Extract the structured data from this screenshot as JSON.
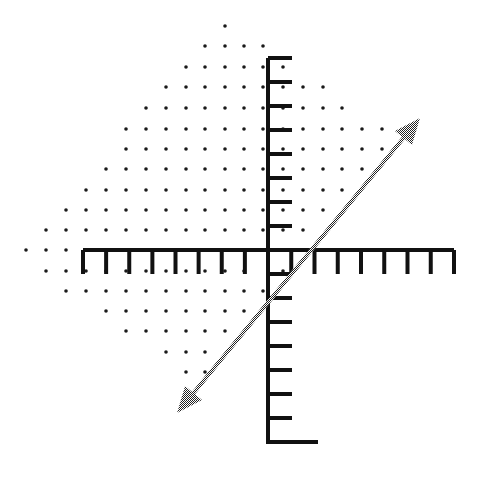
{
  "figure": {
    "type": "graph-of-linear-inequality",
    "colors": {
      "axis": "#111111",
      "dots": "#1a1a1a",
      "line": "#555555",
      "background": "#ffffff"
    },
    "axes": {
      "origin_px": [
        268,
        250
      ],
      "unit_px": 23.5,
      "x_axis": {
        "from_px": 83,
        "to_px": 454,
        "ticks_left": 8,
        "ticks_right": 8,
        "tick_direction": "down",
        "tick_length": 24
      },
      "y_axis": {
        "from_px": 58,
        "to_px": 442,
        "ticks_up": 8,
        "ticks_down": 8,
        "tick_direction": "right",
        "tick_length": 24,
        "bottom_tail_to_px": 318
      }
    },
    "line": {
      "equation": "y = x - 2",
      "slope": 1,
      "y_intercept": -2,
      "x_intercept": 2,
      "start_px": [
        177,
        413
      ],
      "end_px": [
        420,
        118
      ],
      "arrows": "both",
      "style": "dithered"
    },
    "shaded_region": {
      "style": "dot-grid",
      "side": "above-left of line",
      "inequality": "y > x - 2",
      "dot_spacing_px": [
        20,
        20.4
      ],
      "rows": [
        {
          "y": 26,
          "x": [
            225
          ]
        },
        {
          "y": 46,
          "x": [
            205,
            225,
            244,
            263
          ]
        },
        {
          "y": 67,
          "x": [
            186,
            205,
            225,
            244,
            263,
            283
          ]
        },
        {
          "y": 87,
          "x": [
            166,
            186,
            205,
            225,
            244,
            263,
            283,
            303,
            323
          ]
        },
        {
          "y": 108,
          "x": [
            146,
            166,
            186,
            205,
            225,
            244,
            263,
            283,
            303,
            323,
            342
          ]
        },
        {
          "y": 129,
          "x": [
            126,
            146,
            166,
            186,
            205,
            225,
            244,
            263,
            283,
            303,
            323,
            342,
            362,
            382
          ]
        },
        {
          "y": 149,
          "x": [
            126,
            146,
            166,
            186,
            205,
            225,
            244,
            263,
            283,
            303,
            323,
            342,
            362,
            382
          ]
        },
        {
          "y": 169,
          "x": [
            106,
            126,
            146,
            166,
            186,
            205,
            225,
            244,
            263,
            283,
            303,
            323,
            342,
            362
          ]
        },
        {
          "y": 190,
          "x": [
            86,
            106,
            126,
            146,
            166,
            186,
            205,
            225,
            244,
            263,
            283,
            303,
            323,
            342
          ]
        },
        {
          "y": 210,
          "x": [
            66,
            86,
            106,
            126,
            146,
            166,
            186,
            205,
            225,
            244,
            263,
            283,
            303,
            323
          ]
        },
        {
          "y": 230,
          "x": [
            46,
            66,
            86,
            106,
            126,
            146,
            166,
            186,
            205,
            225,
            244,
            263,
            283,
            303
          ]
        },
        {
          "y": 250,
          "x": [
            26,
            46,
            66
          ]
        },
        {
          "y": 271,
          "x": [
            46,
            66,
            86,
            106,
            126,
            146,
            166,
            186,
            205,
            225,
            244,
            283
          ]
        },
        {
          "y": 291,
          "x": [
            66,
            86,
            106,
            126,
            146,
            166,
            186,
            205,
            225,
            244,
            263
          ]
        },
        {
          "y": 311,
          "x": [
            106,
            126,
            146,
            166,
            186,
            205,
            225,
            244
          ]
        },
        {
          "y": 331,
          "x": [
            126,
            146,
            166,
            186,
            205,
            225
          ]
        },
        {
          "y": 352,
          "x": [
            166,
            186,
            205
          ]
        },
        {
          "y": 372,
          "x": [
            186,
            205
          ]
        }
      ]
    }
  }
}
